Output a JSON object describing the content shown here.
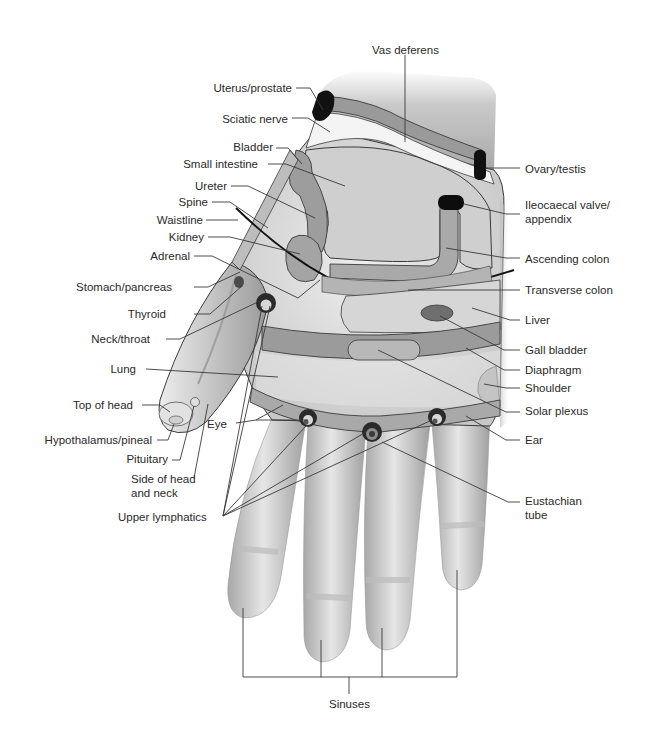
{
  "diagram": {
    "colors": {
      "skin_light": "#e9e9e9",
      "skin_mid": "#d0d0d0",
      "skin_dark": "#a9a9a9",
      "zone_light": "#d4d4d4",
      "zone_mid": "#a8a8a8",
      "zone_dark": "#8c8c8c",
      "point_black": "#111111",
      "outline": "#3b3b3b",
      "label": "#2a2a2a"
    },
    "labels": {
      "vas_deferens": "Vas deferens",
      "uterus_prostate": "Uterus/prostate",
      "sciatic_nerve": "Sciatic nerve",
      "bladder": "Bladder",
      "small_intestine": "Small intestine",
      "ureter": "Ureter",
      "spine": "Spine",
      "waistline": "Waistline",
      "kidney": "Kidney",
      "adrenal": "Adrenal",
      "stomach_pancreas": "Stomach/pancreas",
      "thyroid": "Thyroid",
      "neck_throat": "Neck/throat",
      "lung": "Lung",
      "top_of_head": "Top of head",
      "hypothalamus_pineal": "Hypothalamus/pineal",
      "pituitary": "Pituitary",
      "side_of_head_line1": "Side of head",
      "side_of_head_line2": "and neck",
      "upper_lymphatics": "Upper lymphatics",
      "eye": "Eye",
      "ovary_testis": "Ovary/testis",
      "ileocaecal_line1": "Ileocaecal valve/",
      "ileocaecal_line2": "appendix",
      "ascending_colon": "Ascending colon",
      "transverse_colon": "Transverse colon",
      "liver": "Liver",
      "gall_bladder": "Gall bladder",
      "diaphragm": "Diaphragm",
      "shoulder": "Shoulder",
      "solar_plexus": "Solar plexus",
      "ear": "Ear",
      "eustachian_line1": "Eustachian",
      "eustachian_line2": "tube",
      "sinuses": "Sinuses"
    }
  }
}
